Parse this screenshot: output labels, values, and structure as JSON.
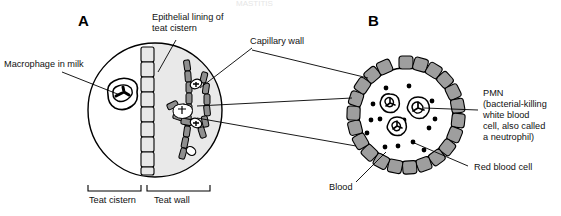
{
  "figure": {
    "faint_top_text": "MASTITIS",
    "panels": [
      {
        "id": "A",
        "letter": "A",
        "x": 78,
        "y": 26
      },
      {
        "id": "B",
        "letter": "B",
        "x": 368,
        "y": 26
      }
    ],
    "labels": {
      "macrophage": "Macrophage in milk",
      "epithelial_line1": "Epithelial lining of",
      "epithelial_line2": "teat cistern",
      "capillary_wall": "Capillary wall",
      "pmn_line1": "PMN",
      "pmn_line2": "(bacterial-killing",
      "pmn_line3": "white blood",
      "pmn_line4": "cell, also called",
      "pmn_line5": "a neutrophil)",
      "red_blood_cell": "Red blood cell",
      "blood": "Blood",
      "teat_cistern": "Teat cistern",
      "teat_wall": "Teat wall"
    },
    "colors": {
      "outline": "#000000",
      "cell_fill": "#e8e8e8",
      "lumen_fill": "#efefef",
      "wall_grey": "#9e9e9e",
      "background": "#ffffff",
      "text": "#111111"
    },
    "panel_a": {
      "circle": {
        "cx": 155,
        "cy": 110,
        "r": 67
      },
      "macrophage": {
        "cx": 121,
        "cy": 97,
        "r": 15
      },
      "epithelial_cell_count": 9,
      "capillary_cell_count": 18
    },
    "panel_b": {
      "circle": {
        "cx": 406,
        "cy": 115,
        "r": 55
      },
      "wall_cell_count": 22,
      "pmn_count": 3,
      "rbc_count": 14,
      "pmns": [
        {
          "cx": 390,
          "cy": 104,
          "r": 9
        },
        {
          "cx": 418,
          "cy": 110,
          "r": 10
        },
        {
          "cx": 397,
          "cy": 128,
          "r": 9
        }
      ],
      "rbcs": [
        {
          "cx": 386,
          "cy": 88
        },
        {
          "cx": 409,
          "cy": 86
        },
        {
          "cx": 373,
          "cy": 104
        },
        {
          "cx": 371,
          "cy": 120
        },
        {
          "cx": 380,
          "cy": 119
        },
        {
          "cx": 385,
          "cy": 147
        },
        {
          "cx": 398,
          "cy": 146
        },
        {
          "cx": 413,
          "cy": 142
        },
        {
          "cx": 429,
          "cy": 128
        },
        {
          "cx": 435,
          "cy": 119
        },
        {
          "cx": 424,
          "cy": 150
        },
        {
          "cx": 367,
          "cy": 133
        },
        {
          "cx": 404,
          "cy": 120
        },
        {
          "cx": 432,
          "cy": 101
        }
      ]
    }
  }
}
